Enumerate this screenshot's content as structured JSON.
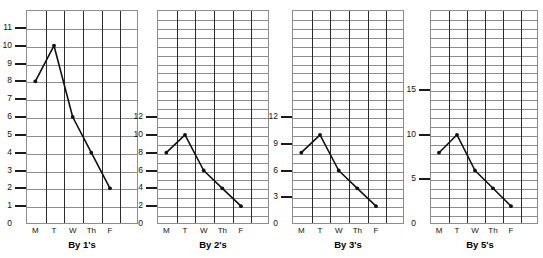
{
  "figure": {
    "days": [
      "M",
      "T",
      "W",
      "Th",
      "F"
    ],
    "values": [
      8,
      10,
      6,
      4,
      2
    ]
  },
  "charts": [
    {
      "caption": "By 1's",
      "type": "line",
      "title": "By 1's",
      "xlabel": "",
      "ylabel": "",
      "categories": [
        "M",
        "T",
        "W",
        "Th",
        "F"
      ],
      "values": [
        8,
        10,
        6,
        4,
        2
      ],
      "ylim": [
        0,
        12
      ],
      "ytick_step": 1,
      "yticks": [
        0,
        1,
        2,
        3,
        4,
        5,
        6,
        7,
        8,
        9,
        10,
        11
      ],
      "ytick_labels": [
        "0",
        "1",
        "2",
        "3",
        "4",
        "5",
        "6",
        "7",
        "8",
        "9",
        "10",
        "11"
      ],
      "grid_rows": 12,
      "grid_cols": 6,
      "grid": true
    },
    {
      "caption": "By 2's",
      "type": "line",
      "title": "By 2's",
      "xlabel": "",
      "ylabel": "",
      "categories": [
        "M",
        "T",
        "W",
        "Th",
        "F"
      ],
      "values": [
        8,
        10,
        6,
        4,
        2
      ],
      "ylim": [
        0,
        24
      ],
      "ytick_step": 2,
      "yticks": [
        0,
        2,
        4,
        6,
        8,
        10,
        12
      ],
      "ytick_labels": [
        "0",
        "2",
        "4",
        "6",
        "8",
        "10",
        "12"
      ],
      "grid_rows": 24,
      "grid_cols": 6,
      "grid": true
    },
    {
      "caption": "By 3's",
      "type": "line",
      "title": "By 3's",
      "xlabel": "",
      "ylabel": "",
      "categories": [
        "M",
        "T",
        "W",
        "Th",
        "F"
      ],
      "values": [
        8,
        10,
        6,
        4,
        2
      ],
      "ylim": [
        0,
        24
      ],
      "ytick_step": 3,
      "yticks": [
        0,
        3,
        6,
        9,
        12
      ],
      "ytick_labels": [
        "0",
        "3",
        "6",
        "9",
        "12"
      ],
      "grid_rows": 24,
      "grid_cols": 6,
      "grid": true
    },
    {
      "caption": "By 5's",
      "type": "line",
      "title": "By 5's",
      "xlabel": "",
      "ylabel": "",
      "categories": [
        "M",
        "T",
        "W",
        "Th",
        "F"
      ],
      "values": [
        8,
        10,
        6,
        4,
        2
      ],
      "ylim": [
        0,
        24
      ],
      "ytick_step": 5,
      "yticks": [
        0,
        5,
        10,
        15
      ],
      "ytick_labels": [
        "0",
        "5",
        "10",
        "15"
      ],
      "grid_rows": 24,
      "grid_cols": 6,
      "grid": true
    }
  ],
  "chart_data": [
    {
      "type": "line",
      "title": "By 1's",
      "categories": [
        "M",
        "T",
        "W",
        "Th",
        "F"
      ],
      "values": [
        8,
        10,
        6,
        4,
        2
      ],
      "xlabel": "",
      "ylabel": "",
      "ylim": [
        0,
        12
      ],
      "ytick_labels": [
        "0",
        "1",
        "2",
        "3",
        "4",
        "5",
        "6",
        "7",
        "8",
        "9",
        "10",
        "11"
      ],
      "grid": true,
      "legend": "none"
    },
    {
      "type": "line",
      "title": "By 2's",
      "categories": [
        "M",
        "T",
        "W",
        "Th",
        "F"
      ],
      "values": [
        8,
        10,
        6,
        4,
        2
      ],
      "xlabel": "",
      "ylabel": "",
      "ylim": [
        0,
        24
      ],
      "ytick_labels": [
        "0",
        "2",
        "4",
        "6",
        "8",
        "10",
        "12"
      ],
      "grid": true,
      "legend": "none"
    },
    {
      "type": "line",
      "title": "By 3's",
      "categories": [
        "M",
        "T",
        "W",
        "Th",
        "F"
      ],
      "values": [
        8,
        10,
        6,
        4,
        2
      ],
      "xlabel": "",
      "ylabel": "",
      "ylim": [
        0,
        24
      ],
      "ytick_labels": [
        "0",
        "3",
        "6",
        "9",
        "12"
      ],
      "grid": true,
      "legend": "none"
    },
    {
      "type": "line",
      "title": "By 5's",
      "categories": [
        "M",
        "T",
        "W",
        "Th",
        "F"
      ],
      "values": [
        8,
        10,
        6,
        4,
        2
      ],
      "xlabel": "",
      "ylabel": "",
      "ylim": [
        0,
        24
      ],
      "ytick_labels": [
        "0",
        "5",
        "10",
        "15"
      ],
      "grid": true,
      "legend": "none"
    }
  ]
}
